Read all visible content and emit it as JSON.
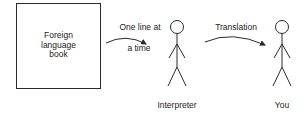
{
  "diagram": {
    "source": {
      "label_lines": [
        "Foreign",
        "language",
        "book"
      ]
    },
    "arrow1": {
      "label_top": "One line at",
      "label_bottom": "a time"
    },
    "interpreter": {
      "label": "Interpreter"
    },
    "arrow2": {
      "label": "Translation"
    },
    "you": {
      "label": "You"
    }
  },
  "colors": {
    "stroke": "#2a2a2a",
    "text": "#222222",
    "background": "#ffffff"
  }
}
